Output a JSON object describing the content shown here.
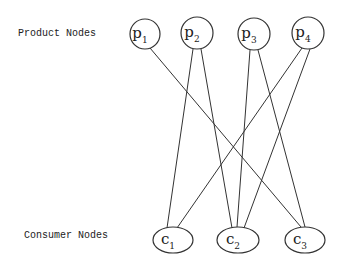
{
  "diagram": {
    "row_labels": {
      "product": "Product Nodes",
      "consumer": "Consumer Nodes"
    },
    "product_nodes": [
      {
        "id": "p1",
        "base": "p",
        "sub": "1",
        "cx": 145,
        "cy": 34,
        "r": 15
      },
      {
        "id": "p2",
        "base": "p",
        "sub": "2",
        "cx": 197,
        "cy": 33,
        "r": 16
      },
      {
        "id": "p3",
        "base": "p",
        "sub": "3",
        "cx": 254,
        "cy": 34,
        "r": 16
      },
      {
        "id": "p4",
        "base": "p",
        "sub": "4",
        "cx": 308,
        "cy": 33,
        "r": 16
      }
    ],
    "consumer_nodes": [
      {
        "id": "c1",
        "base": "c",
        "sub": "1",
        "cx": 173,
        "cy": 240,
        "rx": 20,
        "ry": 13
      },
      {
        "id": "c2",
        "base": "c",
        "sub": "2",
        "cx": 238,
        "cy": 240,
        "rx": 21,
        "ry": 13
      },
      {
        "id": "c3",
        "base": "c",
        "sub": "3",
        "cx": 305,
        "cy": 240,
        "rx": 20,
        "ry": 13
      }
    ],
    "edges": [
      {
        "from": "p1",
        "to": "c3",
        "x1": 150,
        "y1": 48,
        "x2": 301,
        "y2": 227
      },
      {
        "from": "p2",
        "to": "c1",
        "x1": 193,
        "y1": 49,
        "x2": 167,
        "y2": 228
      },
      {
        "from": "p2",
        "to": "c2",
        "x1": 201,
        "y1": 49,
        "x2": 232,
        "y2": 228
      },
      {
        "from": "p3",
        "to": "c2",
        "x1": 250,
        "y1": 50,
        "x2": 237,
        "y2": 227
      },
      {
        "from": "p3",
        "to": "c3",
        "x1": 258,
        "y1": 50,
        "x2": 305,
        "y2": 227
      },
      {
        "from": "p4",
        "to": "c1",
        "x1": 302,
        "y1": 48,
        "x2": 177,
        "y2": 228
      },
      {
        "from": "p4",
        "to": "c2",
        "x1": 310,
        "y1": 49,
        "x2": 244,
        "y2": 228
      }
    ],
    "colors": {
      "stroke": "#333333",
      "background": "#ffffff"
    }
  }
}
